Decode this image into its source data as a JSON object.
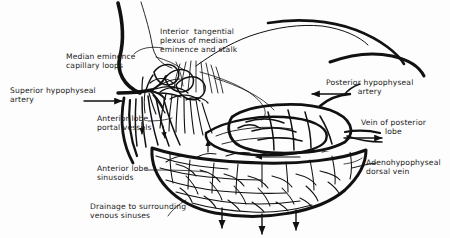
{
  "figure": {
    "background_color": "#fdfdfd",
    "ink_color": "#111111"
  },
  "labels": {
    "median_eminence_capillary_loops": "Median eminence\ncapillary loops",
    "interior_tangential_plexus": "Interior  tangential\nplexus of median\neminence and stalk",
    "superior_hypophyseal_artery": "Superior hypophyseal\nartery",
    "posterior_hypophyseal_artery": "Posterior hypophyseal\nartery",
    "vein_of_posterior_lobe": "Vein of posterior\nlobe",
    "anterior_lobe_portal_vessels": "Anterior lobe\nportal vessels",
    "anterior_lobe_sinusoids": "Anterior lobe\nsinusoids",
    "adenohypophyseal_dorsal_vein": "Adenohypophyseal\ndorsal vein",
    "drainage_to_venous_sinuses": "Drainage to surrounding\nvenous sinuses"
  },
  "structures": [
    {
      "name": "hypothalamus-median-eminence",
      "label": "Median eminence"
    },
    {
      "name": "pituitary-stalk",
      "label": "Stalk"
    },
    {
      "name": "posterior-lobe",
      "label": "Posterior lobe"
    },
    {
      "name": "anterior-lobe",
      "label": "Anterior lobe"
    }
  ],
  "flow_arrows": [
    {
      "name": "superior-hypophyseal-artery-arrow",
      "direction": "right"
    },
    {
      "name": "posterior-hypophyseal-artery-arrow",
      "direction": "left"
    },
    {
      "name": "vein-of-posterior-lobe-arrow",
      "direction": "right"
    },
    {
      "name": "adenohypophyseal-dorsal-vein-arrow",
      "direction": "left"
    },
    {
      "name": "portal-vessel-arrow-1",
      "direction": "down"
    },
    {
      "name": "portal-vessel-arrow-2",
      "direction": "down"
    },
    {
      "name": "sinusoid-inflow-arrow",
      "direction": "up"
    },
    {
      "name": "drainage-arrow-1",
      "direction": "down"
    },
    {
      "name": "drainage-arrow-2",
      "direction": "down"
    },
    {
      "name": "drainage-arrow-3",
      "direction": "down"
    }
  ]
}
